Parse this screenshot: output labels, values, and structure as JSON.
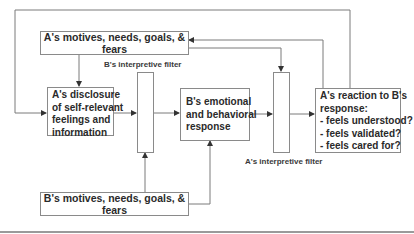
{
  "diagram": {
    "nodes": {
      "a_motives": {
        "text": "A's motives, needs, goals, & fears"
      },
      "a_disclosure": {
        "lines": [
          "A's disclosure",
          "of self-relevant",
          "feelings and",
          "information"
        ]
      },
      "b_filter": {
        "label": "B's interpretive filter"
      },
      "b_response": {
        "lines": [
          "B's emotional",
          "and behavioral",
          "response"
        ]
      },
      "a_filter": {
        "label": "A's interpretive filter"
      },
      "a_reaction": {
        "lines": [
          "A's reaction to B's",
          "response:",
          "- feels understood?",
          "- feels validated?",
          "- feels cared for?"
        ]
      },
      "b_motives": {
        "text": "B's motives, needs, goals, & fears"
      }
    },
    "edges": [
      {
        "from": "a_reaction",
        "to": "a_disclosure",
        "route": "top loop"
      },
      {
        "from": "a_reaction",
        "to": "a_motives"
      },
      {
        "from": "a_motives",
        "to": "a_disclosure"
      },
      {
        "from": "a_motives",
        "to": "a_filter"
      },
      {
        "from": "a_disclosure",
        "to": "b_filter"
      },
      {
        "from": "b_filter",
        "to": "b_response"
      },
      {
        "from": "b_motives",
        "to": "b_filter"
      },
      {
        "from": "b_motives",
        "to": "b_response"
      },
      {
        "from": "b_response",
        "to": "a_filter"
      },
      {
        "from": "a_filter",
        "to": "a_reaction"
      }
    ],
    "colors": {
      "line": "#7a7a7a",
      "border": "#8a8a8a",
      "text": "#2a2a2a"
    }
  }
}
